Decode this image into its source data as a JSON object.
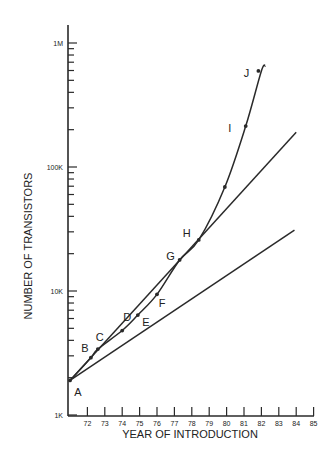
{
  "chart_data": {
    "type": "line",
    "title": "",
    "xlabel": "YEAR OF INTRODUCTION",
    "ylabel": "NUMBER OF TRANSISTORS",
    "yscale": "log",
    "xlim": [
      71,
      85
    ],
    "ylim": [
      1000,
      1500000
    ],
    "grid": false,
    "legend": null,
    "x_ticks": [
      "72",
      "73",
      "74",
      "75",
      "76",
      "77",
      "78",
      "79",
      "80",
      "81",
      "82",
      "83",
      "84",
      "85"
    ],
    "y_ticks": [
      {
        "label": "1K",
        "value": 1000
      },
      {
        "label": "10K",
        "value": 10000
      },
      {
        "label": "100K",
        "value": 100000
      },
      {
        "label": "1M",
        "value": 1000000
      }
    ],
    "series": [
      {
        "name": "Actual devices",
        "style": "curve-with-points",
        "points": [
          {
            "label": "A",
            "x": 71.0,
            "y": 1900
          },
          {
            "label": "B",
            "x": 72.2,
            "y": 2900
          },
          {
            "label": "C",
            "x": 72.6,
            "y": 3400
          },
          {
            "label": "D",
            "x": 74.0,
            "y": 4800
          },
          {
            "label": "E",
            "x": 74.9,
            "y": 6400
          },
          {
            "label": "F",
            "x": 76.0,
            "y": 9400
          },
          {
            "label": "G",
            "x": 77.3,
            "y": 17800
          },
          {
            "label": "H",
            "x": 78.4,
            "y": 25800
          },
          {
            "label": "",
            "x": 79.9,
            "y": 69000
          },
          {
            "label": "I",
            "x": 81.1,
            "y": 214000
          },
          {
            "label": "J",
            "x": 82.0,
            "y": 595000
          }
        ]
      },
      {
        "name": "Upper trend line",
        "style": "straight",
        "points": [
          {
            "x": 71.0,
            "y": 1900
          },
          {
            "x": 84.0,
            "y": 191000
          }
        ]
      },
      {
        "name": "Lower trend line",
        "style": "straight",
        "points": [
          {
            "x": 71.0,
            "y": 1900
          },
          {
            "x": 83.9,
            "y": 31000
          }
        ]
      }
    ],
    "annotations": [
      "A",
      "B",
      "C",
      "D",
      "E",
      "F",
      "G",
      "H",
      "I",
      "J"
    ]
  },
  "colors": {
    "ink": "#2a2a2a",
    "background": "#ffffff"
  }
}
